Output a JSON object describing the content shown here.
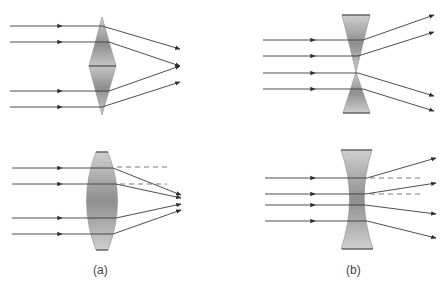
{
  "figure": {
    "panels": [
      {
        "id": "a",
        "label": "(a)",
        "description": "Converging lens: two prisms base-to-base (top), and convex lens (bottom)"
      },
      {
        "id": "b",
        "label": "(b)",
        "description": "Diverging lens: two prisms apex-to-apex (top), and concave lens (bottom)"
      }
    ],
    "colors": {
      "ray": "#3a3a3a",
      "lens_fill": "#a8a8a8",
      "lens_edge": "#6a6a6a",
      "dashed": "#555555"
    }
  }
}
